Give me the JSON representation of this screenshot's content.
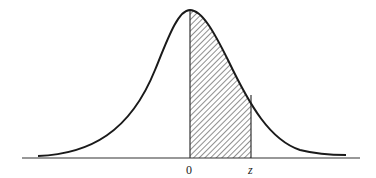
{
  "diagram": {
    "type": "normal-distribution-curve",
    "shaded_region": "area under curve between 0 and z",
    "labels": {
      "origin": "0",
      "z": "z"
    },
    "colors": {
      "curve": "#1a1a1a",
      "axis": "#333333",
      "hatch": "#333333",
      "background": "#ffffff"
    }
  }
}
